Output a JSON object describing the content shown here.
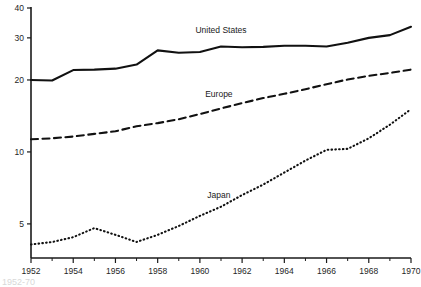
{
  "chart_data": {
    "type": "line",
    "title": "",
    "subtitle": "",
    "xlabel": "",
    "ylabel": "",
    "yscale": "log",
    "ylim": [
      3.6,
      40
    ],
    "xlim": [
      1952,
      1970
    ],
    "grid": false,
    "legend": "inline-labels",
    "y_ticks": [
      5,
      10,
      20,
      30,
      40
    ],
    "y_tick_labels": [
      "5",
      "10",
      "20",
      "30",
      "40"
    ],
    "x_ticks": [
      1952,
      1954,
      1956,
      1958,
      1960,
      1962,
      1964,
      1966,
      1968,
      1970
    ],
    "x_tick_labels": [
      "1952",
      "1954",
      "1956",
      "1958",
      "1960",
      "1962",
      "1964",
      "1966",
      "1968",
      "1970"
    ],
    "x_minor_ticks": [
      1953,
      1955,
      1957,
      1959,
      1961,
      1963,
      1965,
      1967,
      1969
    ],
    "x": [
      1952,
      1953,
      1954,
      1955,
      1956,
      1957,
      1958,
      1959,
      1960,
      1961,
      1962,
      1963,
      1964,
      1965,
      1966,
      1967,
      1968,
      1969,
      1970
    ],
    "series": [
      {
        "name": "United States",
        "style": "solid",
        "color": "#111111",
        "label_x": 1961.0,
        "label_y": 31.3,
        "values": [
          20.0,
          19.9,
          22.0,
          22.1,
          22.3,
          23.2,
          26.6,
          26.0,
          26.2,
          27.6,
          27.4,
          27.5,
          27.8,
          27.8,
          27.6,
          28.6,
          30.0,
          30.8,
          33.4
        ]
      },
      {
        "name": "Europe",
        "style": "dashed",
        "color": "#111111",
        "label_x": 1960.9,
        "label_y": 16.9,
        "values": [
          11.3,
          11.4,
          11.6,
          11.9,
          12.2,
          12.8,
          13.2,
          13.7,
          14.4,
          15.2,
          16.0,
          16.8,
          17.5,
          18.3,
          19.2,
          20.1,
          20.8,
          21.4,
          22.1
        ]
      },
      {
        "name": "Japan",
        "style": "dotted",
        "color": "#111111",
        "label_x": 1960.9,
        "label_y": 6.4,
        "values": [
          4.1,
          4.2,
          4.4,
          4.8,
          4.5,
          4.2,
          4.5,
          4.9,
          5.4,
          5.9,
          6.6,
          7.3,
          8.2,
          9.2,
          10.2,
          10.3,
          11.4,
          13.0,
          15.1
        ]
      }
    ],
    "annotations": [
      {
        "text": "United States",
        "x": 1961.0,
        "y": 31.3
      },
      {
        "text": "Europe",
        "x": 1960.9,
        "y": 16.9
      },
      {
        "text": "Japan",
        "x": 1960.9,
        "y": 6.4
      }
    ],
    "caption": "1952-70"
  }
}
